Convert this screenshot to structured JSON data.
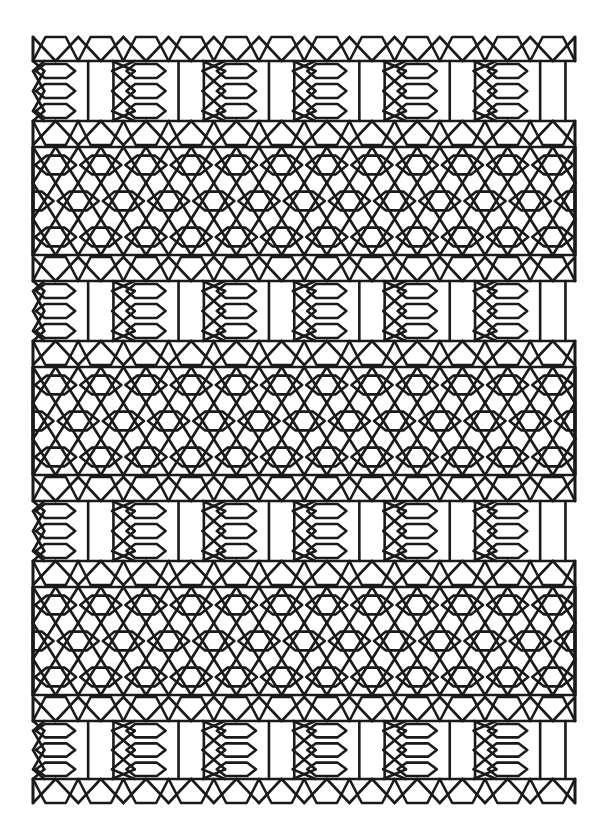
{
  "artwork": {
    "title": "Interlocking Hexagon Lattice Pattern",
    "type": "geometric-line-pattern",
    "background_color": "#ffffff",
    "ink_color": "#1a1a1a",
    "stroke_width": 2.6,
    "canvas": {
      "width": 607,
      "height": 840
    }
  },
  "geometry": {
    "pattern_left": 33,
    "pattern_right": 575,
    "pattern_top": 35,
    "pattern_bottom": 805,
    "column_pitch": 45.2,
    "column_count": 12,
    "half_pitch": 22.6,
    "band_sequence": [
      "A",
      "B",
      "A",
      "B",
      "A",
      "B",
      "A"
    ],
    "band_A_height": 112,
    "band_B_height": 108,
    "band_A_label": "short band: stacked small hexagons with vertical bar pairs",
    "band_B_label": "tall band: three rows of wide hexagons in diamond lattice",
    "band_tops": [
      35,
      147,
      255,
      367,
      475,
      587,
      695
    ],
    "band_bottoms": [
      147,
      255,
      367,
      475,
      587,
      695,
      805
    ],
    "small_hex_rows_per_A": 3,
    "wide_hex_rows_per_B": 3,
    "hex_row_height_A": 30,
    "hex_row_height_B": 34
  },
  "chart_data": {
    "type": "line",
    "title": "Interlocking Hexagon Lattice Pattern",
    "xlabel": "",
    "ylabel": "",
    "categories": [
      "band-A-1",
      "band-B-1",
      "band-A-2",
      "band-B-2",
      "band-A-3",
      "band-B-3",
      "band-A-4"
    ],
    "values": [
      112,
      108,
      112,
      108,
      112,
      108,
      110
    ],
    "series": [
      {
        "name": "band heights (px)",
        "values": [
          112,
          108,
          112,
          108,
          112,
          108,
          110
        ]
      },
      {
        "name": "hex rows per band",
        "values": [
          3,
          3,
          3,
          3,
          3,
          3,
          3
        ]
      }
    ],
    "xlim": [
      0,
      607
    ],
    "ylim": [
      0,
      840
    ],
    "grid": false,
    "legend": "none"
  }
}
